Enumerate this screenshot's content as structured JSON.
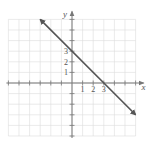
{
  "chart_data": {
    "type": "line",
    "title": "",
    "xlabel": "x",
    "ylabel": "y",
    "xlim": [
      -6,
      6
    ],
    "ylim": [
      -5,
      6
    ],
    "grid": true,
    "equation": "y = -x + 3",
    "series": [
      {
        "name": "line",
        "x": [
          -3,
          0,
          3,
          6
        ],
        "y": [
          6,
          3,
          0,
          -3
        ],
        "arrows": "both"
      }
    ],
    "x_tick_labels": [
      "1",
      "2",
      "3"
    ],
    "y_tick_labels": [
      "1",
      "2",
      "3"
    ],
    "intercepts": {
      "x": 3,
      "y": 3
    },
    "colors": {
      "line": "#555555",
      "grid": "#dcdcdc",
      "axis": "#777777"
    }
  }
}
